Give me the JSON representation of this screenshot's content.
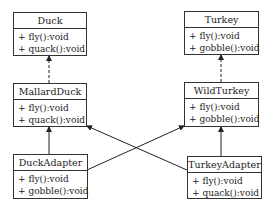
{
  "diagram": {
    "type": "uml-class",
    "classes": [
      {
        "id": "duck",
        "name": "Duck",
        "operations": [
          "+ fly():void",
          "+ quack():void"
        ]
      },
      {
        "id": "turkey",
        "name": "Turkey",
        "operations": [
          "+ fly():void",
          "+ gobble():void"
        ]
      },
      {
        "id": "mallard",
        "name": "MallardDuck",
        "operations": [
          "+ fly():void",
          "+ quack():void"
        ]
      },
      {
        "id": "wildturkey",
        "name": "WildTurkey",
        "operations": [
          "+ fly():void",
          "+ gobble():void"
        ]
      },
      {
        "id": "duckadapter",
        "name": "DuckAdapter",
        "operations": [
          "+ fly():void",
          "+ gobble():void"
        ]
      },
      {
        "id": "turkeyadapter",
        "name": "TurkeyAdapter",
        "operations": [
          "+ fly():void",
          "+ quack():void"
        ]
      }
    ],
    "relations": [
      {
        "from": "MallardDuck",
        "to": "Duck",
        "style": "dashed",
        "kind": "realization"
      },
      {
        "from": "WildTurkey",
        "to": "Turkey",
        "style": "dashed",
        "kind": "realization"
      },
      {
        "from": "DuckAdapter",
        "to": "MallardDuck",
        "style": "solid",
        "kind": "association"
      },
      {
        "from": "TurkeyAdapter",
        "to": "WildTurkey",
        "style": "solid",
        "kind": "association"
      },
      {
        "from": "DuckAdapter",
        "to": "WildTurkey",
        "style": "solid",
        "kind": "association"
      },
      {
        "from": "TurkeyAdapter",
        "to": "MallardDuck",
        "style": "solid",
        "kind": "association"
      }
    ]
  }
}
